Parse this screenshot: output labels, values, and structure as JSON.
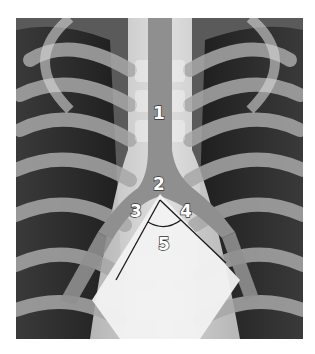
{
  "figure": {
    "labels": [
      {
        "id": "1",
        "text": "1",
        "x": 160,
        "y": 112
      },
      {
        "id": "2",
        "text": "2",
        "x": 160,
        "y": 185
      },
      {
        "id": "3",
        "text": "3",
        "x": 136,
        "y": 212
      },
      {
        "id": "4",
        "text": "4",
        "x": 187,
        "y": 212
      },
      {
        "id": "5",
        "text": "5",
        "x": 165,
        "y": 244
      }
    ],
    "colors": {
      "background": "#ffffff",
      "lung_dark": "#2b2b2b",
      "rib": "#9a9a9a",
      "airway": "#8f8f8f",
      "bright": "#f4f4f4",
      "line": "#1a1a1a"
    }
  }
}
